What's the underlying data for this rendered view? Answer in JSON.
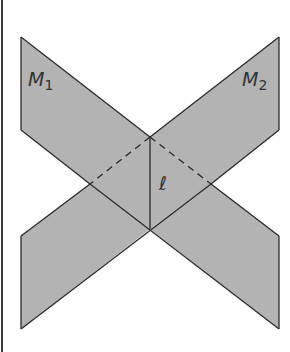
{
  "diagram": {
    "title": "",
    "colors": {
      "plane_fill": "#b3b3b3",
      "edge": "#2a2a2a",
      "background": "#ffffff",
      "label": "#333333"
    },
    "planes": [
      {
        "id": "M1",
        "label": "M",
        "subscript": "1",
        "vertices": [
          [
            21,
            37
          ],
          [
            279,
            236
          ],
          [
            279,
            329
          ],
          [
            21,
            130
          ]
        ]
      },
      {
        "id": "M2",
        "label": "M",
        "subscript": "2",
        "vertices": [
          [
            279,
            37
          ],
          [
            21,
            236
          ],
          [
            21,
            329
          ],
          [
            279,
            130
          ]
        ]
      }
    ],
    "intersection_line": {
      "label": "ℓ",
      "from": [
        150,
        137
      ],
      "to": [
        150,
        229
      ]
    },
    "hidden_edges": [
      {
        "from": [
          150,
          137
        ],
        "to": [
          90,
          184
        ]
      },
      {
        "from": [
          150,
          137
        ],
        "to": [
          211,
          184
        ]
      }
    ]
  }
}
